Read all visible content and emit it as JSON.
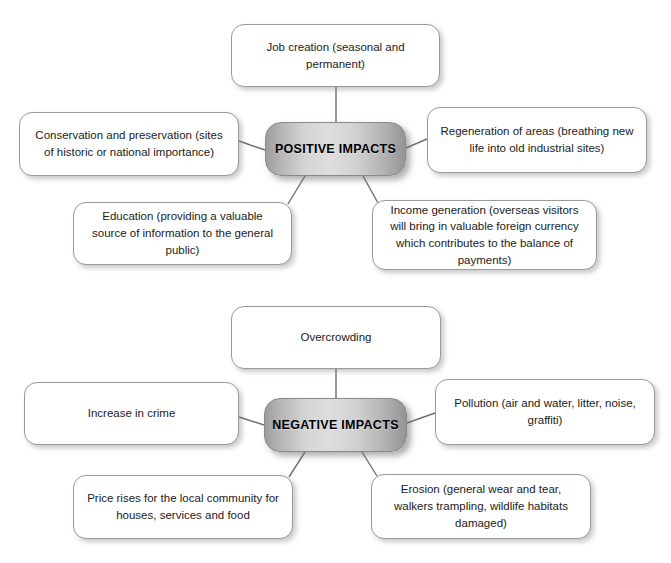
{
  "diagram": {
    "title_hidden": "",
    "background_color": "#ffffff",
    "line_color": "#6f6f6f",
    "leaf_fill": "#ffffff",
    "leaf_border": "#9a9a9a",
    "hub_gradient_dark": "#949494",
    "hub_gradient_light": "#dedede",
    "clusters": [
      {
        "id": "positive",
        "hub": {
          "label": "POSITIVE IMPACTS",
          "x": 265,
          "y": 122,
          "w": 141,
          "h": 54
        },
        "leaves": [
          {
            "id": "job-creation",
            "label": "Job creation (seasonal and permanent)",
            "x": 231,
            "y": 24,
            "w": 209,
            "h": 63
          },
          {
            "id": "conservation",
            "label": "Conservation and preservation (sites of historic or national importance)",
            "x": 19,
            "y": 112,
            "w": 220,
            "h": 64
          },
          {
            "id": "regeneration",
            "label": "Regeneration of areas (breathing new life into old industrial sites)",
            "x": 427,
            "y": 107,
            "w": 220,
            "h": 66
          },
          {
            "id": "education",
            "label": "Education (providing a valuable source of information to the general public)",
            "x": 73,
            "y": 202,
            "w": 219,
            "h": 63
          },
          {
            "id": "income-generation",
            "label": "Income generation (overseas visitors will bring in valuable foreign currency which contributes to the balance of payments)",
            "x": 372,
            "y": 200,
            "w": 225,
            "h": 70
          }
        ],
        "links": [
          {
            "from": "hub-top",
            "to": "job-creation"
          },
          {
            "from": "hub-left",
            "to": "conservation"
          },
          {
            "from": "hub-right",
            "to": "regeneration"
          },
          {
            "from": "hub-bottomleft",
            "to": "education"
          },
          {
            "from": "hub-bottomright",
            "to": "income-generation"
          }
        ]
      },
      {
        "id": "negative",
        "hub": {
          "label": "NEGATIVE IMPACTS",
          "x": 264,
          "y": 398,
          "w": 143,
          "h": 54
        },
        "leaves": [
          {
            "id": "overcrowding",
            "label": "Overcrowding",
            "x": 231,
            "y": 306,
            "w": 210,
            "h": 63
          },
          {
            "id": "increase-in-crime",
            "label": "Increase in crime",
            "x": 24,
            "y": 382,
            "w": 215,
            "h": 63
          },
          {
            "id": "pollution",
            "label": "Pollution (air and water, litter, noise, graffiti)",
            "x": 435,
            "y": 379,
            "w": 220,
            "h": 66
          },
          {
            "id": "price-rises",
            "label": "Price rises for the local community for houses, services and food",
            "x": 73,
            "y": 475,
            "w": 220,
            "h": 64
          },
          {
            "id": "erosion",
            "label": "Erosion (general wear and tear, walkers trampling, wildlife habitats damaged)",
            "x": 371,
            "y": 474,
            "w": 220,
            "h": 65
          }
        ],
        "links": [
          {
            "from": "hub-top",
            "to": "overcrowding"
          },
          {
            "from": "hub-left",
            "to": "increase-in-crime"
          },
          {
            "from": "hub-right",
            "to": "pollution"
          },
          {
            "from": "hub-bottomleft",
            "to": "price-rises"
          },
          {
            "from": "hub-bottomright",
            "to": "erosion"
          }
        ]
      }
    ]
  }
}
